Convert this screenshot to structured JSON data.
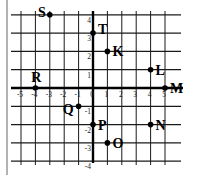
{
  "chart_data": {
    "type": "scatter",
    "title": "",
    "xlabel": "",
    "ylabel": "",
    "xlim": [
      -5,
      5
    ],
    "ylim": [
      -4,
      4
    ],
    "grid": true,
    "x_ticks": [
      -5,
      -4,
      -3,
      -2,
      -1,
      0,
      1,
      2,
      3,
      4,
      5
    ],
    "y_ticks": [
      4,
      3,
      2,
      1,
      -1,
      -2,
      -3,
      -4
    ],
    "x_tick_labels": [
      "-5",
      "-4",
      "-3",
      "-2",
      "-1",
      "0",
      "1",
      "2",
      "3",
      "4",
      "5"
    ],
    "y_tick_labels": [
      "4",
      "3",
      "2",
      "1",
      "-1",
      "-2",
      "-3",
      "-4"
    ],
    "points": [
      {
        "label": "S",
        "x": -3,
        "y": 4,
        "label_pos": "left"
      },
      {
        "label": "T",
        "x": 0,
        "y": 3,
        "label_pos": "right"
      },
      {
        "label": "K",
        "x": 1,
        "y": 2,
        "label_pos": "right"
      },
      {
        "label": "L",
        "x": 4,
        "y": 1,
        "label_pos": "right"
      },
      {
        "label": "R",
        "x": -4,
        "y": 0,
        "label_pos": "above"
      },
      {
        "label": "M",
        "x": 5,
        "y": 0,
        "label_pos": "right"
      },
      {
        "label": "Q",
        "x": -1,
        "y": -1,
        "label_pos": "left"
      },
      {
        "label": "P",
        "x": 0,
        "y": -2,
        "label_pos": "right"
      },
      {
        "label": "N",
        "x": 4,
        "y": -2,
        "label_pos": "right"
      },
      {
        "label": "O",
        "x": 1,
        "y": -3,
        "label_pos": "right"
      }
    ]
  },
  "style": {
    "line_color": "#1a1a1a",
    "axis_color": "#000000",
    "point_color": "#000000",
    "border_color": "#555555"
  }
}
